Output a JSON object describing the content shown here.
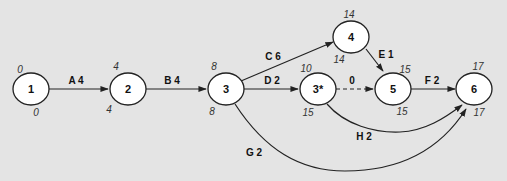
{
  "colors": {
    "background": "#e4e4e4",
    "node_fill": "#ffffff",
    "stroke": "#222222"
  },
  "nodes": [
    {
      "id": "1",
      "label": "1",
      "earliest": "0",
      "latest": "0"
    },
    {
      "id": "2",
      "label": "2",
      "earliest": "4",
      "latest": "4"
    },
    {
      "id": "3",
      "label": "3",
      "earliest": "8",
      "latest": "8"
    },
    {
      "id": "3s",
      "label": "3*",
      "earliest": "10",
      "latest": "15"
    },
    {
      "id": "4",
      "label": "4",
      "earliest": "14",
      "latest": "14"
    },
    {
      "id": "5",
      "label": "5",
      "earliest": "15",
      "latest": "15"
    },
    {
      "id": "6",
      "label": "6",
      "earliest": "17",
      "latest": "17"
    }
  ],
  "edges": [
    {
      "from": "1",
      "to": "2",
      "label": "A 4"
    },
    {
      "from": "2",
      "to": "3",
      "label": "B 4"
    },
    {
      "from": "3",
      "to": "4",
      "label": "C 6"
    },
    {
      "from": "3",
      "to": "3s",
      "label": "D 2"
    },
    {
      "from": "4",
      "to": "5",
      "label": "E 1"
    },
    {
      "from": "3s",
      "to": "5",
      "label": "0",
      "dummy": true
    },
    {
      "from": "5",
      "to": "6",
      "label": "F 2"
    },
    {
      "from": "3",
      "to": "6",
      "label": "G 2"
    },
    {
      "from": "3s",
      "to": "6",
      "label": "H 2"
    }
  ]
}
